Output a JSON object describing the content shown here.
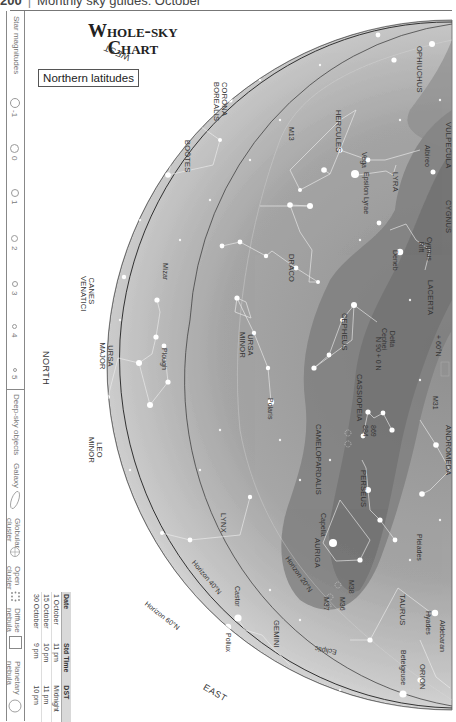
{
  "page_header": {
    "page_number": "200",
    "separator": "|",
    "section": "Monthly sky guides: October"
  },
  "title": {
    "line1": "Whole-sky",
    "line2": "Chart",
    "subtitle": "Northern latitudes"
  },
  "legend": {
    "star_magnitudes_label": "Star magnitudes",
    "magnitudes": [
      "-1",
      "0",
      "1",
      "2",
      "3",
      "4",
      "5"
    ],
    "deep_sky_label": "Deep-sky objects",
    "deep_sky_items": [
      {
        "label": "Galaxy",
        "icon": "galaxy-ellipse-icon"
      },
      {
        "label": "Globular cluster",
        "icon": "globular-cluster-icon"
      },
      {
        "label": "Open cluster",
        "icon": "open-cluster-icon"
      },
      {
        "label": "Diffuse nebula",
        "icon": "diffuse-nebula-square-icon"
      },
      {
        "label": "Planetary nebula",
        "icon": "planetary-nebula-circle-icon"
      }
    ]
  },
  "time_table": {
    "headers": [
      "Date",
      "Std Time",
      "DST"
    ],
    "rows": [
      [
        "1 October",
        "11 pm",
        "Midnight"
      ],
      [
        "15 October",
        "10 pm",
        "11 pm"
      ],
      [
        "30 October",
        "9 pm",
        "10 pm"
      ]
    ]
  },
  "chart": {
    "directions": {
      "west": "WEST",
      "north": "NORTH",
      "east": "EAST"
    },
    "horizons": [
      "Horizon 20°N",
      "Horizon 40°N",
      "Horizon 60°N"
    ],
    "ecliptic": "Ecliptic",
    "constellations": [
      "CORONA BOREALIS",
      "BOÖTES",
      "HERCULES",
      "OPHIUCHUS",
      "VULPECULA",
      "LYRA",
      "CYGNUS",
      "LACERTA",
      "DRACO",
      "CEPHEUS",
      "URSA MINOR",
      "CASSIOPEIA",
      "ANDROMEDA",
      "CAMELOPARDALIS",
      "PERSEUS",
      "CANES VENATICI",
      "URSA MAJOR",
      "LEO MINOR",
      "LYNX",
      "AURIGA",
      "TAURUS",
      "ORION",
      "GEMINI"
    ],
    "stars": [
      "Vega",
      "Epsilon Lyrae",
      "Albireo",
      "Cygnus Rift",
      "Deneb",
      "Delta Cephei",
      "Polaris",
      "Mizar",
      "Plough",
      "Capella",
      "Castor",
      "Pollux",
      "Aldebaran",
      "Hyades",
      "Betelgeuse",
      "Pleiades"
    ],
    "deep_sky_objects": [
      "M13",
      "M31",
      "869",
      "884",
      "M38",
      "M36",
      "M37"
    ],
    "grid_annotations": [
      "N 90 + 0 N",
      "+ 60°N"
    ],
    "colors": {
      "sky_outer": "#e6e6e6",
      "sky_inner": "#9a9a9a",
      "milky_way": "#7e7e7e",
      "horizon_line": "#444444",
      "constellation_line": "#f2f2f2",
      "star": "#ffffff"
    }
  }
}
